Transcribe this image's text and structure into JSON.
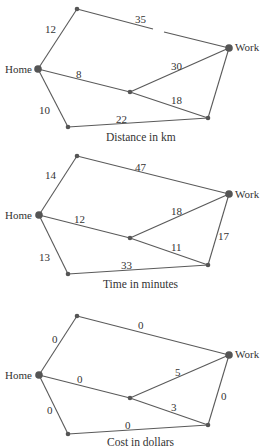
{
  "diagrams": [
    {
      "caption": "Distance in km",
      "nodes": {
        "home": "Home",
        "work": "Work"
      },
      "edges": {
        "home_top": "12",
        "top_work": "35",
        "home_mid": "8",
        "mid_work": "30",
        "mid_br": "18",
        "home_bl": "10",
        "bl_br": "22",
        "br_work": ""
      }
    },
    {
      "caption": "Time in minutes",
      "nodes": {
        "home": "Home",
        "work": "Work"
      },
      "edges": {
        "home_top": "14",
        "top_work": "47",
        "home_mid": "12",
        "mid_work": "18",
        "mid_br": "11",
        "home_bl": "13",
        "bl_br": "33",
        "br_work": "17"
      }
    },
    {
      "caption": "Cost in dollars",
      "nodes": {
        "home": "Home",
        "work": "Work"
      },
      "edges": {
        "home_top": "0",
        "top_work": "0",
        "home_mid": "0",
        "mid_work": "5",
        "mid_br": "3",
        "home_bl": "0",
        "bl_br": "0",
        "br_work": "0"
      }
    }
  ]
}
